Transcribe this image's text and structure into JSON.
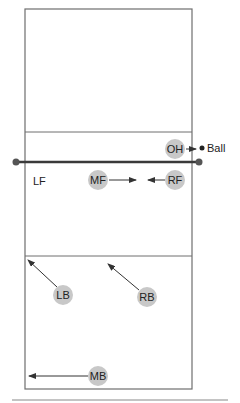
{
  "diagram": {
    "labels": {
      "ball": "Ball",
      "lf": "LF"
    },
    "players": [
      {
        "id": "OH",
        "label": "OH",
        "x": 175,
        "y": 149
      },
      {
        "id": "MF",
        "label": "MF",
        "x": 98,
        "y": 180
      },
      {
        "id": "RF",
        "label": "RF",
        "x": 175,
        "y": 180
      },
      {
        "id": "LB",
        "label": "LB",
        "x": 63,
        "y": 295
      },
      {
        "id": "RB",
        "label": "RB",
        "x": 147,
        "y": 297
      },
      {
        "id": "MB",
        "label": "MB",
        "x": 98,
        "y": 376
      }
    ],
    "colors": {
      "court_line": "#6e6e6e",
      "net": "#3a3a3a",
      "player_fill": "#c8c8c8",
      "arrow": "#333333"
    }
  }
}
